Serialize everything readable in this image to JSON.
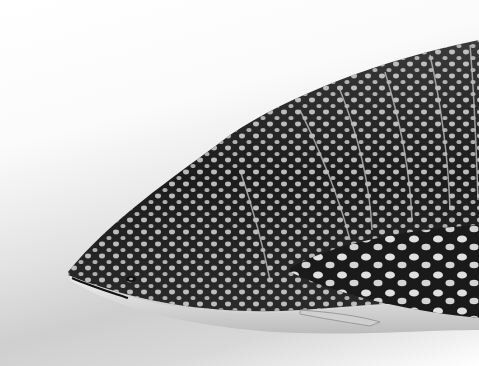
{
  "image": {
    "subject": "whale shark illustration",
    "style": "grayscale",
    "colors": {
      "body": "#1e1e1e",
      "spots": "#dcdcdc",
      "belly": "#e6e6e6",
      "background": "#f2f2f2"
    }
  }
}
